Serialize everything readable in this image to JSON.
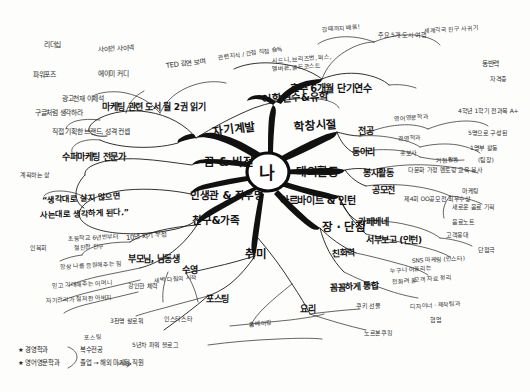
{
  "document": {
    "type": "hand-drawn mind map",
    "language": "Korean",
    "title": "나"
  },
  "center": {
    "label": "나"
  },
  "branches": [
    {
      "id": "self-development",
      "label": "자기계발",
      "children": [
        {
          "label": "마케팅 관련 도서 월 2권 읽기"
        },
        {
          "label": "TED 강연 보며"
        },
        {
          "label": "관련지식 / 간접 직접 습득"
        },
        {
          "label": "사이먼 사이넥"
        },
        {
          "label": "리더십"
        },
        {
          "label": "에이미 커디"
        },
        {
          "label": "파워포즈"
        },
        {
          "label": "광고천재 이제석"
        },
        {
          "label": "구글처럼 생각하라"
        },
        {
          "label": "직접 기획한 브랜드, 성격 컨셉"
        },
        {
          "label": "수퍼마케팅 전문가"
        }
      ]
    },
    {
      "id": "study-abroad",
      "label": "어학연수&유학",
      "children": [
        {
          "label": "호주 6개월 단기연수"
        },
        {
          "label": "시드니, 브리즈번, 퍼스,"
        },
        {
          "label": "멜버른, 골드코스트"
        },
        {
          "label": "주요 5개 도시 여행"
        },
        {
          "label": "갈때까지 배움!"
        },
        {
          "label": "세계각국 친구 사귀기"
        },
        {
          "label": "동반력"
        },
        {
          "label": "자격증"
        }
      ]
    },
    {
      "id": "school-days",
      "label": "학창시절",
      "children": [
        {
          "label": "전공"
        },
        {
          "label": "영어영문학과"
        },
        {
          "label": "경영학과"
        },
        {
          "label": "4학년 1학기 전과목 A+"
        },
        {
          "label": "동아리"
        },
        {
          "label": "홍보사"
        },
        {
          "label": "거점활동"
        },
        {
          "label": "5명으로 구성된"
        },
        {
          "label": "1명부 활동"
        },
        {
          "label": "(팀장)"
        }
      ]
    },
    {
      "id": "external-activity",
      "label": "대외활동",
      "children": [
        {
          "label": "봉사활동"
        },
        {
          "label": "다문화 가정 멘토링 교육 봉사"
        },
        {
          "label": "공모전"
        },
        {
          "label": "제4회 OO공모전 최우수상"
        },
        {
          "label": "마케팅"
        },
        {
          "label": "새로운 음료 기획"
        },
        {
          "label": "음료노트"
        }
      ]
    },
    {
      "id": "parttime-intern",
      "label": "아르바이트 & 인턴",
      "children": [
        {
          "label": "카페베네"
        },
        {
          "label": "고객응대"
        },
        {
          "label": "서부보고 (인턴)"
        },
        {
          "label": "단점극"
        },
        {
          "label": "SNS 마케팅 (인스타)"
        },
        {
          "label": "고객 자료 정리"
        }
      ]
    },
    {
      "id": "strengths-weaknesses",
      "label": "장 · 단점",
      "children": [
        {
          "label": "친화력"
        },
        {
          "label": "누구나 어울리는"
        },
        {
          "label": "천화려 꿀"
        },
        {
          "label": "꼼꼼하게 통합"
        },
        {
          "label": "디자이너 · 제작팀과"
        },
        {
          "label": "협업"
        }
      ]
    },
    {
      "id": "hobby",
      "label": "취미",
      "children": [
        {
          "label": "수영"
        },
        {
          "label": "포스팅"
        },
        {
          "label": "요리"
        },
        {
          "label": "홈베이킹"
        },
        {
          "label": "쿠키 선물"
        },
        {
          "label": "노르본쿠킹"
        }
      ]
    },
    {
      "id": "friends-family",
      "label": "친구&가족",
      "children": [
        {
          "label": "10년 지기 우정"
        },
        {
          "label": "부모님, 남동생"
        },
        {
          "label": "초등학교 6년반부터"
        },
        {
          "label": "절친한 친구"
        },
        {
          "label": "인복회"
        },
        {
          "label": "항상 나를 응원해주는 힘"
        },
        {
          "label": "믿고 기대해주는 어머니"
        },
        {
          "label": "자기관리가 철저한 아버지"
        },
        {
          "label": "강인한 체력"
        },
        {
          "label": "새벽 다짐의 시작"
        },
        {
          "label": "3천명 팔로워"
        },
        {
          "label": "인스타스타"
        },
        {
          "label": "5년차 파워 블로그"
        }
      ]
    },
    {
      "id": "life-philosophy",
      "label": "인생관 & 좌우명",
      "children": [
        {
          "label": "“생각대로 살지 않으면"
        },
        {
          "label": "사는대로 생각하게 된다.”"
        },
        {
          "label": "계획하는 삶"
        }
      ]
    },
    {
      "id": "dream-vision",
      "label": "꿈 & 비전",
      "children": []
    }
  ],
  "footnote": {
    "star1": "★ 경영학과",
    "star2": "★ 영어영문학과",
    "brace": "복수전공",
    "result": "졸업 → 해외 마케팅 직원"
  },
  "colors": {
    "ink": "#111111",
    "paper": "#fdfdfc"
  }
}
